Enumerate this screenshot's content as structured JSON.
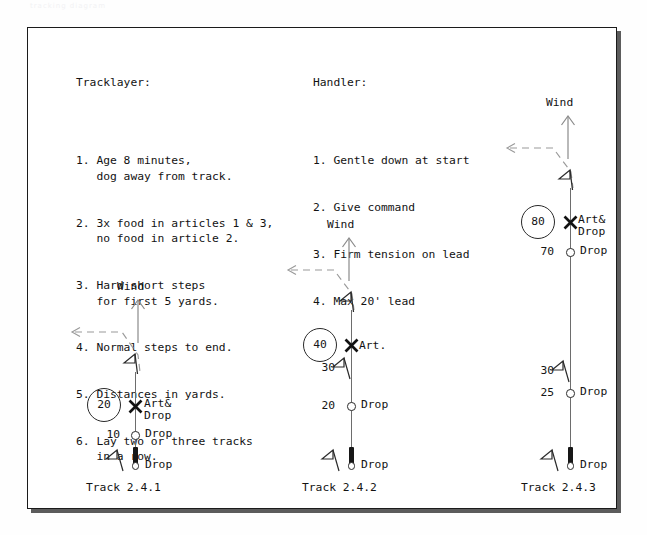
{
  "watermark": "tracking diagram",
  "tracklayer": {
    "title": "Tracklayer:",
    "items": [
      "1. Age 8 minutes,\n   dog away from track.",
      "2. 3x food in articles 1 & 3,\n   no food in article 2.",
      "3. Hard short steps\n   for first 5 yards.",
      "4. Normal steps to end.",
      "5. Distances in yards.",
      "6. Lay two or three tracks\n   in a row."
    ]
  },
  "handler": {
    "title": "Handler:",
    "items": [
      "1. Gentle down at start",
      "2. Give command",
      "3. Firm tension on lead",
      "4. Max 20' lead"
    ]
  },
  "tracks": [
    {
      "caption": "Track 2.4.1",
      "wind_label": "Wind",
      "markers": [
        {
          "distance": "20",
          "distance_style": "circle",
          "label": "Art&\nDrop",
          "symbol": "x-mark"
        },
        {
          "distance": "10",
          "distance_style": "plain",
          "label": "Drop",
          "symbol": "ring"
        },
        {
          "distance": "",
          "distance_style": "none",
          "label": "Drop",
          "symbol": "start"
        }
      ]
    },
    {
      "caption": "Track 2.4.2",
      "wind_label": "Wind",
      "markers": [
        {
          "distance": "40",
          "distance_style": "circle",
          "label": "Art.",
          "symbol": "x-mark"
        },
        {
          "distance": "30",
          "distance_style": "plain",
          "label": "",
          "symbol": "flag"
        },
        {
          "distance": "20",
          "distance_style": "plain",
          "label": "Drop",
          "symbol": "ring"
        },
        {
          "distance": "",
          "distance_style": "none",
          "label": "Drop",
          "symbol": "start"
        }
      ]
    },
    {
      "caption": "Track 2.4.3",
      "wind_label": "Wind",
      "markers": [
        {
          "distance": "80",
          "distance_style": "circle",
          "label": "Art&\nDrop",
          "symbol": "x-mark"
        },
        {
          "distance": "70",
          "distance_style": "plain",
          "label": "Drop",
          "symbol": "ring"
        },
        {
          "distance": "30",
          "distance_style": "plain",
          "label": "",
          "symbol": "flag"
        },
        {
          "distance": "25",
          "distance_style": "plain",
          "label": "Drop",
          "symbol": "ring"
        },
        {
          "distance": "",
          "distance_style": "none",
          "label": "Drop",
          "symbol": "start"
        }
      ]
    }
  ],
  "colors": {
    "ink": "#131313",
    "track_line": "#6d6d6d",
    "dash_line": "#8d8d8d",
    "frame": "#1b1b1b",
    "paper": "#ffffff"
  }
}
